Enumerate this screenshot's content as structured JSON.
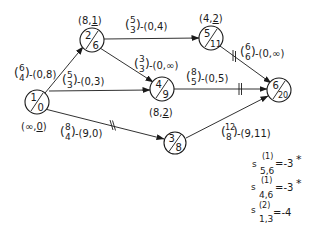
{
  "diagram": {
    "type": "network-flow",
    "nodes": [
      {
        "id": "1",
        "top": "1",
        "bottom": "0",
        "label": "(∞,0)",
        "label_parts": [
          "(∞,",
          "0",
          ")"
        ],
        "cx": 37,
        "cy": 102
      },
      {
        "id": "2",
        "top": "2",
        "bottom": "6",
        "label": "(8,1)",
        "label_parts": [
          "(8,",
          "1",
          ")"
        ],
        "cx": 92,
        "cy": 40
      },
      {
        "id": "3",
        "top": "3",
        "bottom": "8",
        "label": "",
        "cx": 175,
        "cy": 143
      },
      {
        "id": "4",
        "top": "4",
        "bottom": "9",
        "label": "(8,2)",
        "label_parts": [
          "(8,",
          "2",
          ")"
        ],
        "cx": 162,
        "cy": 89
      },
      {
        "id": "5",
        "top": "5",
        "bottom": "11",
        "label": "(4,2)",
        "label_parts": [
          "(4,",
          "2",
          ")"
        ],
        "cx": 211,
        "cy": 38
      },
      {
        "id": "6",
        "top": "6",
        "bottom": "20",
        "label": "",
        "cx": 279,
        "cy": 90
      }
    ],
    "edges": [
      {
        "from": "1",
        "to": "2",
        "frac_top": "6",
        "frac_bottom": "4",
        "pair": "-(0,8)",
        "ticks": 0
      },
      {
        "from": "1",
        "to": "4",
        "frac_top": "5",
        "frac_bottom": "3",
        "pair": "-(0,3)",
        "ticks": 0
      },
      {
        "from": "1",
        "to": "3",
        "frac_top": "8",
        "frac_bottom": "4",
        "pair": "-(9,0)",
        "ticks": 2
      },
      {
        "from": "2",
        "to": "5",
        "frac_top": "5",
        "frac_bottom": "3",
        "pair": "-(0,4)",
        "ticks": 0
      },
      {
        "from": "2",
        "to": "4",
        "frac_top": "3",
        "frac_bottom": "3",
        "pair": "-(0,∞)",
        "ticks": 0
      },
      {
        "from": "5",
        "to": "6",
        "frac_top": "6",
        "frac_bottom": "6",
        "pair": "-(0,∞)",
        "ticks": 2
      },
      {
        "from": "4",
        "to": "6",
        "frac_top": "8",
        "frac_bottom": "5",
        "pair": "-(0,5)",
        "ticks": 2
      },
      {
        "from": "3",
        "to": "6",
        "frac_top": "12",
        "frac_bottom": "8",
        "pair": "-(9,11)",
        "ticks": 0
      }
    ],
    "annotations": [
      {
        "symbol": "s",
        "superscript": "(1)",
        "subscript": "5,6",
        "value": "=-3",
        "mark": "*"
      },
      {
        "symbol": "s",
        "superscript": "(1)",
        "subscript": "4,6",
        "value": "=-3",
        "mark": "*"
      },
      {
        "symbol": "s",
        "superscript": "(2)",
        "subscript": "1,3",
        "value": "=-4",
        "mark": ""
      }
    ]
  },
  "n1": {
    "top": "1",
    "bottom": "0",
    "lbl_a": "(∞,",
    "lbl_b": "0",
    "lbl_c": ")"
  },
  "n2": {
    "top": "2",
    "bottom": "6",
    "lbl_a": "(8,",
    "lbl_b": "1",
    "lbl_c": ")"
  },
  "n3": {
    "top": "3",
    "bottom": "8"
  },
  "n4": {
    "top": "4",
    "bottom": "9",
    "lbl_a": "(8,",
    "lbl_b": "2",
    "lbl_c": ")"
  },
  "n5": {
    "top": "5",
    "bottom": "11",
    "lbl_a": "(4,",
    "lbl_b": "2",
    "lbl_c": ")"
  },
  "n6": {
    "top": "6",
    "bottom": "20"
  },
  "e12": {
    "ft": "6",
    "fb": "4",
    "pair": "-(0,8)"
  },
  "e14": {
    "ft": "5",
    "fb": "3",
    "pair": "-(0,3)"
  },
  "e13": {
    "ft": "8",
    "fb": "4",
    "pair": "-(9,0)"
  },
  "e25": {
    "ft": "5",
    "fb": "3",
    "pair": "-(0,4)"
  },
  "e24": {
    "ft": "3",
    "fb": "3",
    "pair": "-(0,∞)"
  },
  "e56": {
    "ft": "6",
    "fb": "6",
    "pair": "-(0,∞)"
  },
  "e46": {
    "ft": "8",
    "fb": "5",
    "pair": "-(0,5)"
  },
  "e36": {
    "ft": "12",
    "fb": "8",
    "pair": "-(9,11)"
  },
  "a1": {
    "s": "s",
    "sup": "(1)",
    "sub": "5,6",
    "val": "=-3",
    "mark": "*"
  },
  "a2": {
    "s": "s",
    "sup": "(1)",
    "sub": "4,6",
    "val": "=-3",
    "mark": "*"
  },
  "a3": {
    "s": "s",
    "sup": "(2)",
    "sub": "1,3",
    "val": "=-4",
    "mark": ""
  },
  "paren_open": "(",
  "paren_close": ")"
}
